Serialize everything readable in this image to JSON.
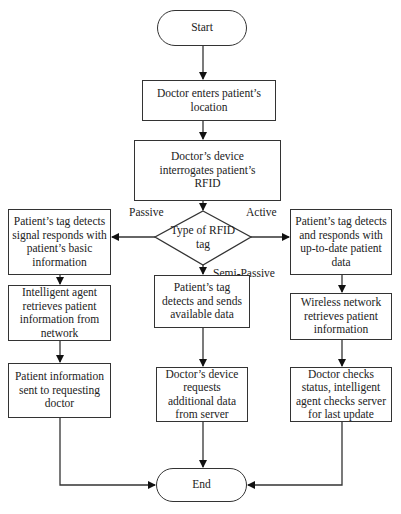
{
  "diagram": {
    "type": "flowchart",
    "start": {
      "label": "Start"
    },
    "end": {
      "label": "End"
    },
    "steps": {
      "enter_location": "Doctor enters patient’s location",
      "interrogate": "Doctor’s device interrogates patient’s RFID"
    },
    "decision": {
      "label": "Type of RFID tag",
      "branches": {
        "left": "Passive",
        "right": "Active",
        "down": "Semi-Passive"
      }
    },
    "passive_branch": [
      "Patient’s tag detects signal responds with patient’s basic information",
      "Intelligent agent retrieves patient information from network",
      "Patient information sent to requesting doctor"
    ],
    "semi_passive_branch": [
      "Patient’s tag detects and sends available data",
      "Doctor’s device requests additional data from server"
    ],
    "active_branch": [
      "Patient’s tag detects and responds with up-to-date patient data",
      "Wireless network retrieves patient information",
      "Doctor checks status, intelligent agent checks server for last update"
    ],
    "colors": {
      "stroke": "#333333",
      "background": "#ffffff",
      "text": "#222222"
    }
  }
}
